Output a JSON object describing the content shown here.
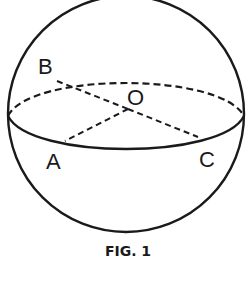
{
  "figure": {
    "caption": "FIG. 1",
    "labels": {
      "B": "B",
      "O": "O",
      "A": "A",
      "C": "C"
    },
    "stroke_color": "#1a1a1a",
    "background": "#ffffff"
  }
}
